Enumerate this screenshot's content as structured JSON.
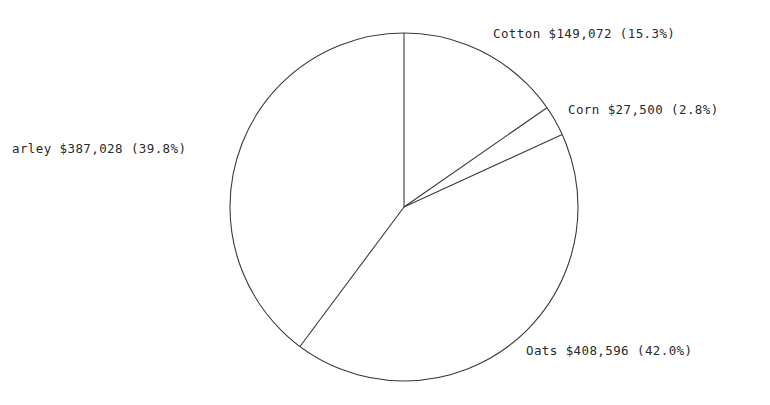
{
  "chart_data": {
    "type": "pie",
    "title": "",
    "categories": [
      "Cotton",
      "Corn",
      "Oats",
      "Barley"
    ],
    "values": [
      149072,
      27500,
      408596,
      387028
    ],
    "percentages": [
      15.3,
      2.8,
      42.0,
      39.8
    ],
    "labels": [
      "Cotton $149,072 (15.3%)",
      "Corn $27,500 (2.8%)",
      "Oats $408,596 (42.0%)",
      "arley $387,028 (39.8%)"
    ],
    "start_angle": "12 o'clock",
    "direction": "clockwise",
    "legend": "none",
    "grid": false
  },
  "colors": {
    "outline": "#3a3a3a",
    "text": "#2a2a2a",
    "background": "#ffffff"
  }
}
